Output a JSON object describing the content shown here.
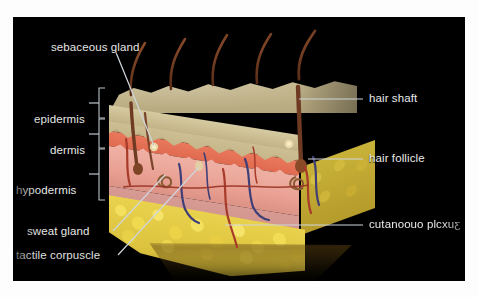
{
  "figure": {
    "domain": "anatomical-illustration",
    "background_color": "#000000",
    "page_color": "#fdfdfd",
    "label_text_color": "#e8e8e8",
    "leader_line_color": "#cfd6dc"
  },
  "layer_brackets": [
    {
      "id": "epidermis",
      "label": "epidermis",
      "tick": "–"
    },
    {
      "id": "dermis",
      "label": "dermis",
      "tick": "–"
    },
    {
      "id": "hypodermis",
      "label": "hypodermis",
      "tick": "–"
    }
  ],
  "callouts": {
    "top_left": {
      "label": "sebaceous gland",
      "side": "left"
    },
    "bottom_left_1": {
      "label": "sweat gland",
      "side": "left"
    },
    "bottom_left_2": {
      "label": "tactile corpuscle",
      "side": "left"
    },
    "right_1": {
      "label": "hair shaft",
      "side": "right"
    },
    "right_2": {
      "label": "hair follicle",
      "side": "right"
    },
    "right_3": {
      "label": "cutanoouo plcxuƹ",
      "side": "right",
      "note": "mirrored-reversed text in source image"
    }
  },
  "anatomy_colors": {
    "epidermis": "#c6b789",
    "papillary_dermis": "#e4704f",
    "dermis": "#eaa89b",
    "hypodermis_fat": "#ecd44a",
    "hair": "#6e3a22",
    "artery": "#a83a2a",
    "vein": "#3f3f78"
  },
  "structures": [
    {
      "name": "hair-shaft",
      "count": 5
    },
    {
      "name": "hair-follicle",
      "count": 3
    },
    {
      "name": "sebaceous-gland",
      "count": 2
    },
    {
      "name": "sweat-gland",
      "count": 2
    },
    {
      "name": "tactile-corpuscle",
      "count": 1
    },
    {
      "name": "cutaneous-plexus",
      "count": 1
    }
  ]
}
